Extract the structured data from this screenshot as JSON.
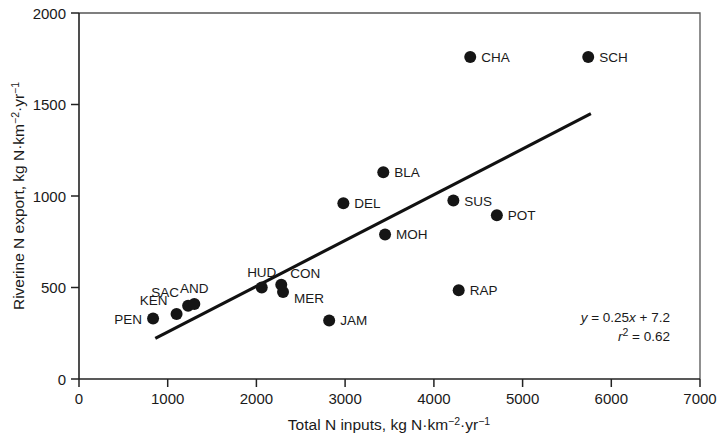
{
  "chart_data": {
    "type": "scatter",
    "title": "",
    "xlabel": "Total N inputs, kg N·km⁻²·yr⁻¹",
    "ylabel": "Riverine N export, kg N·km⁻²·yr⁻¹",
    "xlim": [
      0,
      7000
    ],
    "ylim": [
      0,
      2000
    ],
    "xticks": [
      0,
      1000,
      2000,
      3000,
      4000,
      5000,
      6000,
      7000
    ],
    "yticks": [
      0,
      500,
      1000,
      1500,
      2000
    ],
    "xtick_labels": [
      "0",
      "1000",
      "2000",
      "3000",
      "4000",
      "5000",
      "6000",
      "7000"
    ],
    "ytick_labels": [
      "0",
      "500",
      "1000",
      "1500",
      "2000"
    ],
    "grid": false,
    "legend": false,
    "marker_color": "#151515",
    "line_color": "#111111",
    "points": [
      {
        "label": "PEN",
        "x": 835,
        "y": 330,
        "label_pos": "left"
      },
      {
        "label": "KEN",
        "x": 1100,
        "y": 355,
        "label_pos": "upleft"
      },
      {
        "label": "SAC",
        "x": 1230,
        "y": 400,
        "label_pos": "upleft"
      },
      {
        "label": "AND",
        "x": 1300,
        "y": 410,
        "label_pos": "up"
      },
      {
        "label": "HUD",
        "x": 2060,
        "y": 500,
        "label_pos": "up"
      },
      {
        "label": "MER",
        "x": 2300,
        "y": 475,
        "label_pos": "lowright"
      },
      {
        "label": "CON",
        "x": 2280,
        "y": 515,
        "label_pos": "upright"
      },
      {
        "label": "JAM",
        "x": 2820,
        "y": 320,
        "label_pos": "right"
      },
      {
        "label": "DEL",
        "x": 2980,
        "y": 960,
        "label_pos": "right"
      },
      {
        "label": "BLA",
        "x": 3430,
        "y": 1130,
        "label_pos": "right"
      },
      {
        "label": "MOH",
        "x": 3450,
        "y": 790,
        "label_pos": "right"
      },
      {
        "label": "SUS",
        "x": 4220,
        "y": 975,
        "label_pos": "right"
      },
      {
        "label": "RAP",
        "x": 4280,
        "y": 485,
        "label_pos": "right"
      },
      {
        "label": "CHA",
        "x": 4410,
        "y": 1760,
        "label_pos": "right"
      },
      {
        "label": "POT",
        "x": 4710,
        "y": 895,
        "label_pos": "right"
      },
      {
        "label": "SCH",
        "x": 5740,
        "y": 1760,
        "label_pos": "right"
      }
    ],
    "fit_line": {
      "slope": 0.25,
      "intercept": 7.2,
      "x_start": 860,
      "x_end": 5770,
      "equation": "y = 0.25x + 7.2",
      "r_squared_text": "r2 = 0.62",
      "r_squared": 0.62
    },
    "annotations": {
      "equation_parts": {
        "y": "y",
        "eq1": " = 0.25",
        "x": "x",
        "eq2": " + 7.2"
      },
      "r_parts": {
        "r": "r",
        "sup": "2",
        "rest": " = 0.62"
      }
    }
  },
  "axis": {
    "y_title_parts": {
      "main": "Riverine N export, kg N·km",
      "sup1": "−2",
      "mid": "·yr",
      "sup2": "−1"
    },
    "x_title_parts": {
      "main": "Total N inputs, kg N·km",
      "sup1": "−2",
      "mid": "·yr",
      "sup2": "−1"
    }
  }
}
